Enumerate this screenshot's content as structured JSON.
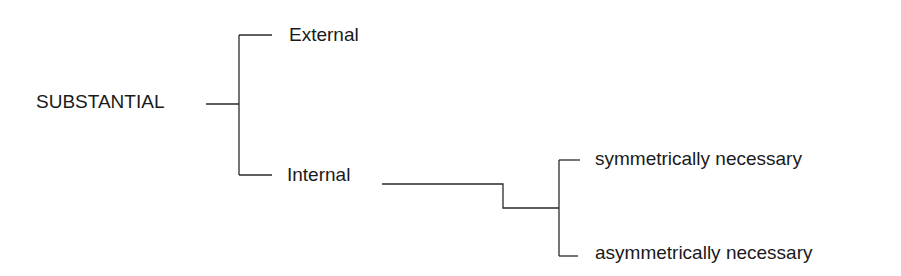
{
  "diagram": {
    "type": "tree",
    "root": {
      "label": "SUBSTANTIAL"
    },
    "level1": [
      {
        "label": "External"
      },
      {
        "label": "Internal"
      }
    ],
    "level2": [
      {
        "parent": "Internal",
        "label": "symmetrically necessary"
      },
      {
        "parent": "Internal",
        "label": "asymmetrically necessary"
      }
    ],
    "line_color": "#2a2a2a",
    "text_color": "#1a1a1a"
  }
}
